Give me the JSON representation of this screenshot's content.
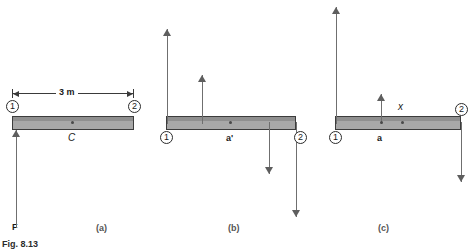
{
  "figure": {
    "caption": "Fig. 8.13",
    "beam_color": "#a8a8a8",
    "beam_edge_color": "#3c3c3c"
  },
  "panels": [
    {
      "key": "a",
      "sublabel": "(a)",
      "dimension": {
        "text": "3 m"
      },
      "node_left": "1",
      "node_right": "2",
      "center_label": "C",
      "force_label": "F"
    },
    {
      "key": "b",
      "sublabel": "(b)",
      "node_left": "1",
      "node_right": "2",
      "center_label": "a'"
    },
    {
      "key": "c",
      "sublabel": "(c)",
      "node_left": "1",
      "node_right": "2",
      "center_label": "a",
      "x_label": "x"
    }
  ]
}
